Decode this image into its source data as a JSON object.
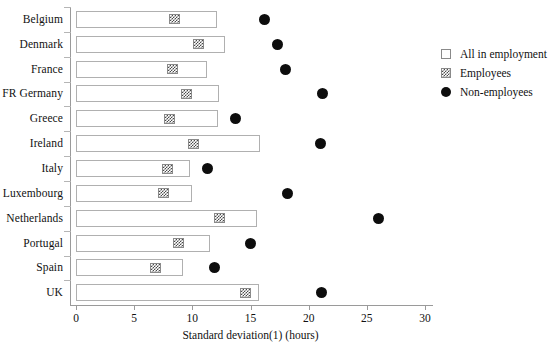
{
  "chart_data": {
    "type": "bar",
    "title": "",
    "subtitle": "",
    "xlabel": "Standard deviation(1) (hours)",
    "ylabel": "",
    "xlim": [
      0,
      30
    ],
    "xticks": [
      0,
      5,
      10,
      15,
      20,
      25,
      30
    ],
    "xtick_labels": [
      "0",
      "5",
      "10",
      "15",
      "20",
      "25",
      "30"
    ],
    "grid": false,
    "orientation": "horizontal",
    "legend_position": "right-top",
    "categories": [
      "Belgium",
      "Denmark",
      "France",
      "FR Germany",
      "Greece",
      "Ireland",
      "Italy",
      "Luxembourg",
      "Netherlands",
      "Portugal",
      "Spain",
      "UK"
    ],
    "series": [
      {
        "name": "All in employment",
        "marker": "bar",
        "values": [
          12.1,
          12.8,
          11.3,
          12.3,
          12.2,
          15.8,
          9.8,
          10.0,
          15.6,
          11.5,
          9.2,
          15.7
        ]
      },
      {
        "name": "Employees",
        "marker": "hatched-square",
        "values": [
          8.5,
          10.5,
          8.3,
          9.5,
          8.0,
          10.1,
          7.9,
          7.5,
          12.3,
          8.8,
          6.8,
          14.6
        ]
      },
      {
        "name": "Non-employees",
        "marker": "filled-circle",
        "values": [
          16.2,
          17.3,
          18.0,
          21.2,
          13.7,
          21.0,
          11.3,
          18.2,
          26.0,
          15.0,
          11.9,
          21.1
        ]
      }
    ]
  },
  "legend": {
    "items": [
      {
        "label": "All in employment",
        "swatch": "blank-square"
      },
      {
        "label": "Employees",
        "swatch": "hatched-square"
      },
      {
        "label": "Non-employees",
        "swatch": "filled-circle"
      }
    ]
  },
  "colors": {
    "bar_fill": "#ffffff",
    "bar_stroke": "#b0b0b0",
    "hatch_ink": "#4a4a4a",
    "dot": "#0d0d0d",
    "axis": "#9a9a9a",
    "text": "#111111"
  }
}
